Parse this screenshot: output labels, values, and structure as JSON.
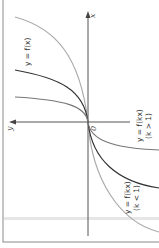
{
  "diagram": {
    "title": "",
    "orientation": "rotated 90 degrees (x-axis points up, y-axis points left)",
    "axes": {
      "x_label": "x",
      "y_label": "y",
      "origin_label": "0"
    },
    "curves": [
      {
        "name": "base",
        "label": "y = f(x)",
        "condition": "",
        "color": "#333333"
      },
      {
        "name": "compressed",
        "label": "y = f(kx)",
        "condition": "(k > 1)",
        "color": "#777777"
      },
      {
        "name": "stretched",
        "label": "y = f(kx)",
        "condition": "(k < 1)",
        "color": "#aaaaaa"
      }
    ],
    "colors": {
      "axis": "#555555",
      "border": "#888888",
      "background": "#ffffff",
      "stripe": "#dddddd"
    }
  }
}
